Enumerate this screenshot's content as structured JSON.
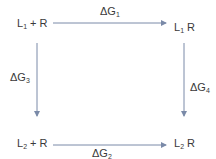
{
  "nodes": {
    "top_left": {
      "main": "L",
      "sub": "1",
      "rest": " + R"
    },
    "top_right": {
      "main": "L",
      "sub": "1",
      "rest": " R"
    },
    "bottom_left": {
      "main": "L",
      "sub": "2",
      "rest": " + R"
    },
    "bottom_right": {
      "main": "L",
      "sub": "2",
      "rest": " R"
    }
  },
  "edges": {
    "top": {
      "main": "ΔG",
      "sub": "1"
    },
    "bottom": {
      "main": "ΔG",
      "sub": "2"
    },
    "left": {
      "main": "ΔG",
      "sub": "3"
    },
    "right": {
      "main": "ΔG",
      "sub": "4"
    }
  },
  "colors": {
    "arrow": "#7a8aa8",
    "text": "#3a3a3a"
  }
}
